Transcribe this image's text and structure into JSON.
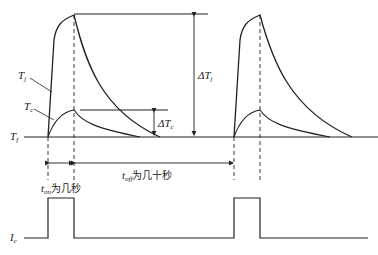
{
  "diagram": {
    "type": "timing diagram",
    "labels": {
      "tj": {
        "main": "T",
        "sub": "j"
      },
      "tc": {
        "main": "T",
        "sub": "c"
      },
      "tf": {
        "main": "T",
        "sub": "f"
      },
      "ic": {
        "main": "I",
        "sub": "c"
      },
      "delta_tj": {
        "prefix": "ΔT",
        "sub": "j"
      },
      "delta_tc": {
        "prefix": "ΔT",
        "sub": "c"
      },
      "t_on": {
        "main": "t",
        "sub": "on",
        "text": "为几秒"
      },
      "t_off": {
        "main": "t",
        "sub": "off",
        "text": "为几十秒"
      }
    },
    "colors": {
      "line": "#222222",
      "background": "#ffffff"
    }
  }
}
